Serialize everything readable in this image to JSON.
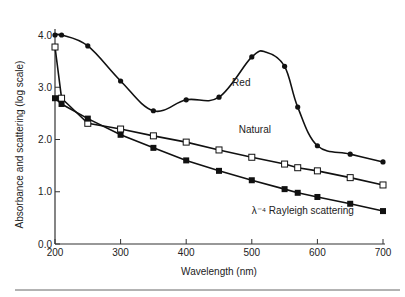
{
  "chart_data": {
    "type": "line",
    "title": "",
    "xlabel": "Wavelength (nm)",
    "ylabel": "Absorbance and scattering (log scale)",
    "xlim": [
      200,
      700
    ],
    "ylim": [
      0,
      4
    ],
    "xticks": [
      "200",
      "300",
      "400",
      "500",
      "600",
      "700"
    ],
    "yticks": [
      "0.0",
      "1.0",
      "2.0",
      "3.0",
      "4.0"
    ],
    "grid": false,
    "legend": "inline labels",
    "series": [
      {
        "name": "Red",
        "marker": "filled-circle",
        "x": [
          200,
          210,
          250,
          300,
          350,
          400,
          450,
          500,
          550,
          570,
          600,
          650,
          700
        ],
        "y": [
          4.0,
          4.0,
          3.79,
          3.12,
          2.55,
          2.76,
          2.81,
          3.58,
          3.4,
          2.62,
          1.88,
          1.72,
          1.57
        ]
      },
      {
        "name": "Natural",
        "marker": "open-square",
        "x": [
          200,
          210,
          250,
          300,
          350,
          400,
          450,
          500,
          550,
          570,
          600,
          650,
          700
        ],
        "y": [
          3.77,
          2.79,
          2.31,
          2.2,
          2.07,
          1.95,
          1.8,
          1.66,
          1.53,
          1.46,
          1.4,
          1.27,
          1.13
        ]
      },
      {
        "name": "λ⁻⁴ Rayleigh scattering",
        "marker": "filled-square",
        "x": [
          200,
          210,
          250,
          300,
          350,
          400,
          450,
          500,
          550,
          570,
          600,
          650,
          700
        ],
        "y": [
          2.79,
          2.68,
          2.4,
          2.09,
          1.84,
          1.6,
          1.4,
          1.22,
          1.05,
          0.98,
          0.9,
          0.77,
          0.63
        ]
      }
    ],
    "annotations": [
      {
        "text": "Red",
        "x": 470,
        "y": 3.1
      },
      {
        "text": "Natural",
        "x": 480,
        "y": 2.2
      },
      {
        "text": "λ⁻⁴ Rayleigh scattering",
        "x": 500,
        "y": 0.65
      }
    ]
  }
}
